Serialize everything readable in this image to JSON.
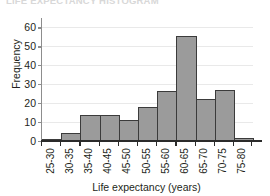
{
  "figure": {
    "clipped_heading": "LIFE EXPECTANCY HISTOGRAM"
  },
  "chart_data": {
    "type": "bar",
    "title": "",
    "xlabel": "Life expectancy (years)",
    "ylabel": "Frequency",
    "categories": [
      "25-30",
      "30-35",
      "35-40",
      "40-45",
      "45-50",
      "50-55",
      "55-60",
      "60-65",
      "65-70",
      "70-75",
      "75-80"
    ],
    "values": [
      1,
      4,
      14,
      14,
      11,
      18,
      26.5,
      55.5,
      22,
      27,
      1.5
    ],
    "ylim": [
      0,
      65
    ],
    "yticks": [
      0,
      10,
      20,
      30,
      40,
      50,
      60
    ],
    "ytick_labels": [
      "0",
      "10",
      "20",
      "30",
      "40",
      "50",
      "60"
    ],
    "grid": true,
    "legend": "none",
    "bar_color": "#9b9b9b",
    "bar_edge_color": "#3b3b3b",
    "axis_color": "#2b2b2b",
    "grid_color": "#e9e9e9"
  }
}
